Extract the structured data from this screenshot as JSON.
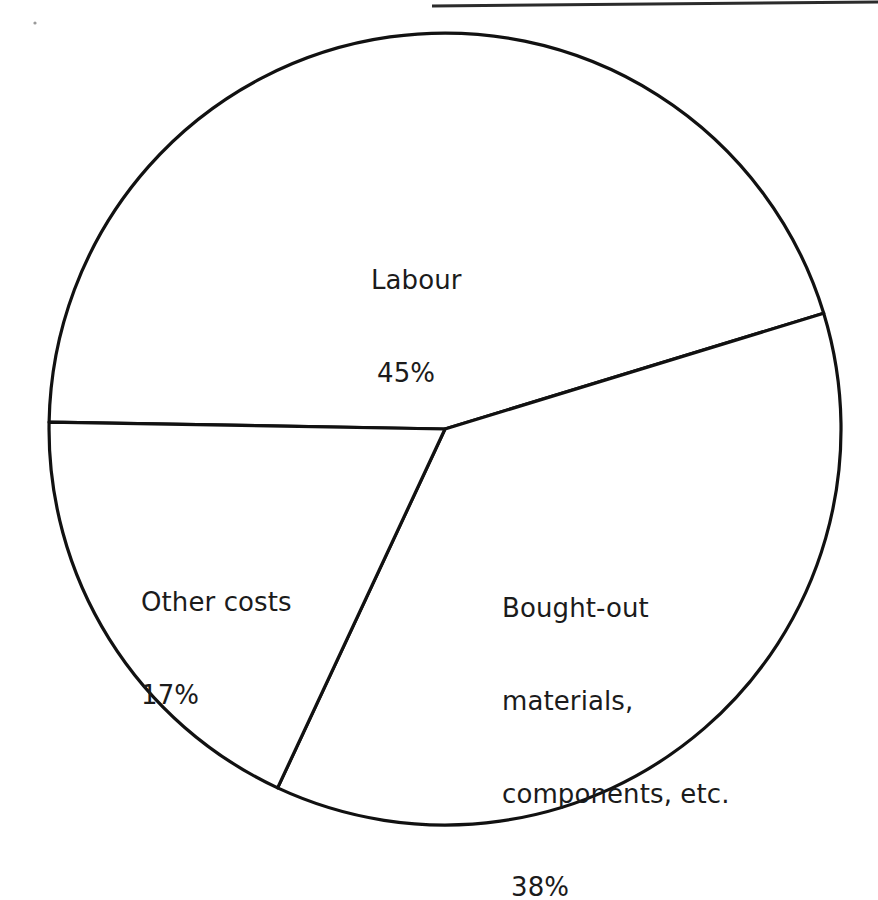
{
  "chart_data": {
    "type": "pie",
    "title": "",
    "subtitle": "",
    "xlabel": "",
    "ylabel": "",
    "legend_position": "none",
    "grid": false,
    "units": "percent",
    "total": 100,
    "categories": [
      "Labour",
      "Bought-out materials, components, etc.",
      "Other costs"
    ],
    "values": [
      45,
      38,
      17
    ],
    "slices": [
      {
        "name": "labour",
        "label": "Labour",
        "value": 45,
        "value_label": "45%",
        "color": "#ffffff",
        "edge_color": "#111111",
        "start_angle_deg": 181,
        "end_angle_deg": 343
      },
      {
        "name": "bought-out",
        "label_lines": [
          "Bought-out",
          "materials,",
          "components, etc."
        ],
        "label": "Bought-out materials, components, etc.",
        "value": 38,
        "value_label": "38%",
        "color": "#ffffff",
        "edge_color": "#111111",
        "start_angle_deg": 343,
        "end_angle_deg": 115
      },
      {
        "name": "other-costs",
        "label": "Other costs",
        "value": 17,
        "value_label": "17%",
        "color": "#ffffff",
        "edge_color": "#111111",
        "start_angle_deg": 115,
        "end_angle_deg": 181
      }
    ],
    "geometry": {
      "center_x": 445,
      "center_y": 429,
      "radius": 396
    }
  },
  "labels": {
    "labour": {
      "name": "Labour",
      "value": "45%"
    },
    "bought_out": {
      "line1": "Bought-out",
      "line2": "materials,",
      "line3": "components, etc.",
      "value": "38%"
    },
    "other_costs": {
      "name": "Other costs",
      "value": "17%"
    }
  },
  "colors": {
    "background": "#ffffff",
    "outline": "#111111",
    "text": "#1b1b1b",
    "rule": "#2b2b2b"
  }
}
